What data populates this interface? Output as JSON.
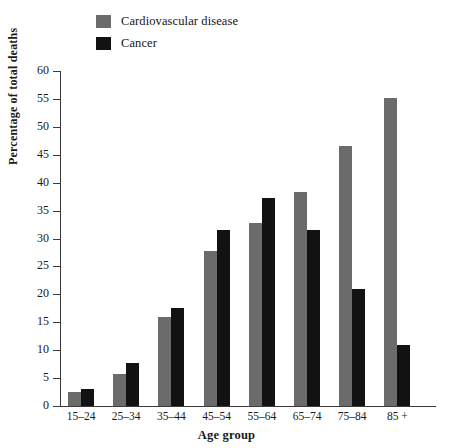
{
  "chart_data": {
    "type": "bar",
    "title": "",
    "subtitle": "",
    "xlabel": "Age group",
    "ylabel": "Percentage of total deaths",
    "categories": [
      "15–24",
      "25–34",
      "35–44",
      "45–54",
      "55–64",
      "65–74",
      "75–84",
      "85 +"
    ],
    "series": [
      {
        "name": "Cardiovascular disease",
        "color": "#6b6b6b",
        "values": [
          2.5,
          5.8,
          16.0,
          27.8,
          32.8,
          38.4,
          46.5,
          55.2
        ]
      },
      {
        "name": "Cancer",
        "color": "#121212",
        "values": [
          3.0,
          7.7,
          17.5,
          31.6,
          37.3,
          31.6,
          21.0,
          11.0
        ]
      }
    ],
    "ylim": [
      0,
      60
    ],
    "ytick_step": 5,
    "yticks": [
      "0",
      "5",
      "10",
      "15",
      "20",
      "25",
      "30",
      "35",
      "40",
      "45",
      "50",
      "55",
      "60"
    ],
    "grid": false,
    "legend_position": "top-left",
    "axis_color": "#3a3a3a"
  },
  "legend": {
    "items": [
      {
        "label": "Cardiovascular disease",
        "color": "#6b6b6b"
      },
      {
        "label": "Cancer",
        "color": "#121212"
      }
    ]
  }
}
